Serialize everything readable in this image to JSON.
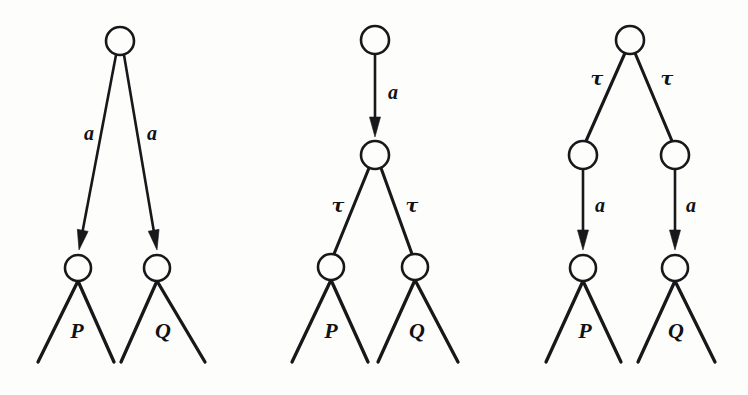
{
  "figure": {
    "kind": "process-tree-diagrams",
    "background_color": "#fdfdfb",
    "ink_color": "#17181a",
    "diagram_count": 3
  },
  "diagrams": [
    {
      "id": "diagram-left",
      "name": "a.P + a.Q",
      "root": {
        "cx": 120,
        "cy": 41,
        "r": 14
      },
      "nodes": [
        {
          "id": "left-root",
          "cx": 120,
          "cy": 41,
          "r": 14
        },
        {
          "id": "left-child-p",
          "cx": 78,
          "cy": 268,
          "r": 13
        },
        {
          "id": "left-child-q",
          "cx": 157,
          "cy": 268,
          "r": 13
        }
      ],
      "edges": [
        {
          "id": "left-edge-a1",
          "label": "a",
          "label_x": 89,
          "label_y": 140,
          "x1": 116,
          "y1": 55,
          "x2": 79,
          "y2": 250,
          "arrow": true
        },
        {
          "id": "left-edge-a2",
          "label": "a",
          "label_x": 152,
          "label_y": 140,
          "x1": 124,
          "y1": 55,
          "x2": 157,
          "y2": 250,
          "arrow": true
        }
      ],
      "fans": [
        {
          "id": "left-fan-p",
          "label": "P",
          "label_x": 77,
          "label_y": 338,
          "apex_x": 78,
          "apex_y": 281,
          "left_x": 38,
          "left_y": 362,
          "right_x": 114,
          "right_y": 362
        },
        {
          "id": "left-fan-q",
          "label": "Q",
          "label_x": 163,
          "label_y": 338,
          "apex_x": 157,
          "apex_y": 281,
          "left_x": 121,
          "left_y": 362,
          "right_x": 205,
          "right_y": 362
        }
      ]
    },
    {
      "id": "diagram-middle",
      "name": "a.(tau.P + tau.Q)",
      "root": {
        "cx": 375,
        "cy": 40,
        "r": 14
      },
      "nodes": [
        {
          "id": "mid-root",
          "cx": 375,
          "cy": 40,
          "r": 14
        },
        {
          "id": "mid-inner",
          "cx": 375,
          "cy": 155,
          "r": 14
        },
        {
          "id": "mid-child-p",
          "cx": 331,
          "cy": 267,
          "r": 13
        },
        {
          "id": "mid-child-q",
          "cx": 415,
          "cy": 267,
          "r": 13
        }
      ],
      "edges": [
        {
          "id": "mid-edge-a",
          "label": "a",
          "label_x": 393,
          "label_y": 99,
          "x1": 375,
          "y1": 54,
          "x2": 375,
          "y2": 137,
          "arrow": true
        },
        {
          "id": "mid-edge-tau1",
          "label": "τ",
          "label_x": 338,
          "label_y": 212,
          "x1": 369,
          "y1": 168,
          "x2": 334,
          "y2": 254,
          "arrow": false
        },
        {
          "id": "mid-edge-tau2",
          "label": "τ",
          "label_x": 412,
          "label_y": 212,
          "x1": 381,
          "y1": 168,
          "x2": 412,
          "y2": 254,
          "arrow": false
        }
      ],
      "fans": [
        {
          "id": "mid-fan-p",
          "label": "P",
          "label_x": 331,
          "label_y": 338,
          "apex_x": 331,
          "apex_y": 280,
          "left_x": 292,
          "left_y": 362,
          "right_x": 368,
          "right_y": 362
        },
        {
          "id": "mid-fan-q",
          "label": "Q",
          "label_x": 417,
          "label_y": 338,
          "apex_x": 415,
          "apex_y": 280,
          "left_x": 378,
          "left_y": 362,
          "right_x": 458,
          "right_y": 362
        }
      ]
    },
    {
      "id": "diagram-right",
      "name": "tau.a.P + tau.a.Q",
      "root": {
        "cx": 630,
        "cy": 40,
        "r": 14
      },
      "nodes": [
        {
          "id": "right-root",
          "cx": 630,
          "cy": 40,
          "r": 14
        },
        {
          "id": "right-inner-p",
          "cx": 583,
          "cy": 155,
          "r": 14
        },
        {
          "id": "right-inner-q",
          "cx": 675,
          "cy": 155,
          "r": 14
        },
        {
          "id": "right-child-p",
          "cx": 583,
          "cy": 268,
          "r": 13
        },
        {
          "id": "right-child-q",
          "cx": 675,
          "cy": 268,
          "r": 13
        }
      ],
      "edges": [
        {
          "id": "right-edge-tau1",
          "label": "τ",
          "label_x": 597,
          "label_y": 85,
          "x1": 625,
          "y1": 53,
          "x2": 586,
          "y2": 141,
          "arrow": false
        },
        {
          "id": "right-edge-tau2",
          "label": "τ",
          "label_x": 667,
          "label_y": 85,
          "x1": 635,
          "y1": 53,
          "x2": 672,
          "y2": 141,
          "arrow": false
        },
        {
          "id": "right-edge-a1",
          "label": "a",
          "label_x": 600,
          "label_y": 212,
          "x1": 583,
          "y1": 169,
          "x2": 583,
          "y2": 250,
          "arrow": true
        },
        {
          "id": "right-edge-a2",
          "label": "a",
          "label_x": 691,
          "label_y": 212,
          "x1": 675,
          "y1": 169,
          "x2": 675,
          "y2": 250,
          "arrow": true
        }
      ],
      "fans": [
        {
          "id": "right-fan-p",
          "label": "P",
          "label_x": 585,
          "label_y": 338,
          "apex_x": 583,
          "apex_y": 281,
          "left_x": 546,
          "left_y": 362,
          "right_x": 621,
          "right_y": 362
        },
        {
          "id": "right-fan-q",
          "label": "Q",
          "label_x": 676,
          "label_y": 338,
          "apex_x": 675,
          "apex_y": 281,
          "left_x": 638,
          "left_y": 362,
          "right_x": 715,
          "right_y": 362
        }
      ]
    }
  ],
  "labels": {
    "action_a": "a",
    "action_tau": "τ",
    "process_p": "P",
    "process_q": "Q"
  }
}
